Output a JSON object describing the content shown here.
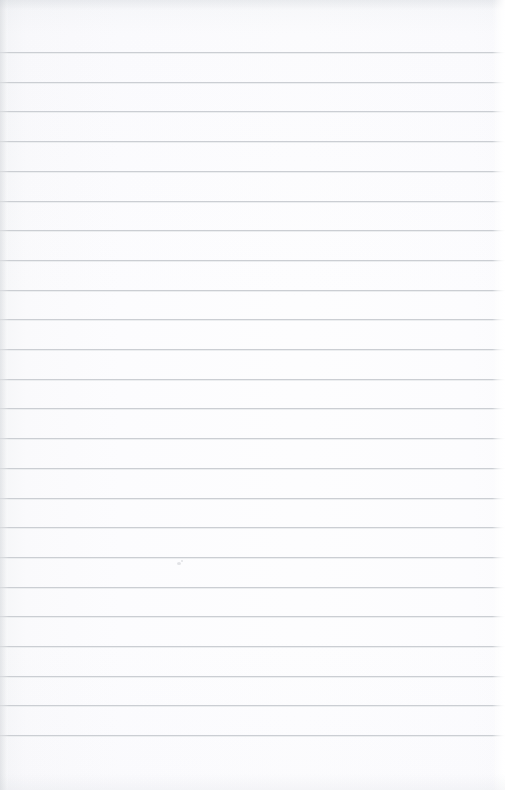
{
  "page": {
    "kind": "lined-paper",
    "width": 505,
    "height": 790,
    "paper_color": "#fdfdfe",
    "rule_color": "#c9ccd1",
    "content_text": "",
    "has_handwriting": false,
    "has_header_text": false
  },
  "ruling": {
    "line_count": 24,
    "first_line_y": 52,
    "line_spacing": 29.7,
    "line_thickness": 1,
    "left_inset": 0,
    "right_inset": 0,
    "top_margin_height": 52,
    "bottom_margin_height": 55,
    "margin_rule": null,
    "line_ys": [
      52,
      81.7,
      111.4,
      141.1,
      170.8,
      200.5,
      230.2,
      259.9,
      289.6,
      319.3,
      349,
      378.7,
      408.4,
      438.1,
      467.8,
      497.5,
      527.2,
      556.9,
      586.6,
      616.3,
      646,
      675.7,
      705.4,
      735.1
    ]
  },
  "blemishes": [
    {
      "name": "paper-speck",
      "x": 177,
      "y": 562,
      "w": 4,
      "h": 3
    },
    {
      "name": "paper-speck",
      "x": 181,
      "y": 560,
      "w": 2,
      "h": 2
    }
  ],
  "writing_lines": [
    {
      "index": 1,
      "text": ""
    },
    {
      "index": 2,
      "text": ""
    },
    {
      "index": 3,
      "text": ""
    },
    {
      "index": 4,
      "text": ""
    },
    {
      "index": 5,
      "text": ""
    },
    {
      "index": 6,
      "text": ""
    },
    {
      "index": 7,
      "text": ""
    },
    {
      "index": 8,
      "text": ""
    },
    {
      "index": 9,
      "text": ""
    },
    {
      "index": 10,
      "text": ""
    },
    {
      "index": 11,
      "text": ""
    },
    {
      "index": 12,
      "text": ""
    },
    {
      "index": 13,
      "text": ""
    },
    {
      "index": 14,
      "text": ""
    },
    {
      "index": 15,
      "text": ""
    },
    {
      "index": 16,
      "text": ""
    },
    {
      "index": 17,
      "text": ""
    },
    {
      "index": 18,
      "text": ""
    },
    {
      "index": 19,
      "text": ""
    },
    {
      "index": 20,
      "text": ""
    },
    {
      "index": 21,
      "text": ""
    },
    {
      "index": 22,
      "text": ""
    },
    {
      "index": 23,
      "text": ""
    },
    {
      "index": 24,
      "text": ""
    }
  ]
}
